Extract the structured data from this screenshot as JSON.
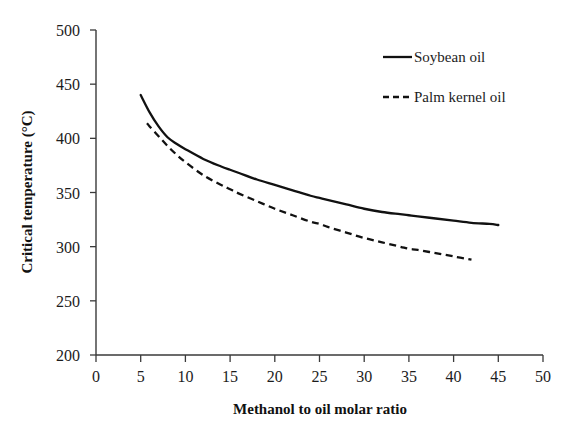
{
  "chart_data": {
    "type": "line",
    "title": "",
    "xlabel": "Methanol to oil molar ratio",
    "ylabel": "Critical temperature (°C)",
    "xlim": [
      0,
      50
    ],
    "ylim": [
      200,
      500
    ],
    "xticks": [
      0,
      5,
      10,
      15,
      20,
      25,
      30,
      35,
      40,
      45,
      50
    ],
    "yticks": [
      200,
      250,
      300,
      350,
      400,
      450,
      500
    ],
    "xtick_labels": [
      "0",
      "5",
      "10",
      "15",
      "20",
      "25",
      "30",
      "35",
      "40",
      "45",
      "50"
    ],
    "ytick_labels": [
      "200",
      "250",
      "300",
      "350",
      "400",
      "450",
      "500"
    ],
    "grid": false,
    "legend_position": "top-right",
    "series": [
      {
        "name": "Soybean oil",
        "style": "solid",
        "color": "#111111",
        "x": [
          5,
          6,
          7,
          8,
          9,
          10,
          12,
          14,
          15,
          16,
          18,
          20,
          22,
          24,
          25,
          26,
          28,
          30,
          32,
          34,
          35,
          36,
          38,
          40,
          42,
          44,
          45
        ],
        "y": [
          440,
          424,
          411,
          401,
          395,
          390,
          381,
          374,
          371,
          368,
          362,
          357,
          352,
          347,
          345,
          343,
          339,
          335,
          332,
          330,
          329,
          328,
          326,
          324,
          322,
          321,
          320
        ]
      },
      {
        "name": "Palm kernel oil",
        "style": "dashed",
        "color": "#111111",
        "x": [
          5.7,
          6,
          7,
          8,
          9,
          10,
          12,
          14,
          15,
          16,
          18,
          20,
          22,
          24,
          25,
          26,
          28,
          30,
          32,
          34,
          35,
          36,
          38,
          40,
          42
        ],
        "y": [
          414,
          411,
          402,
          393,
          385,
          378,
          366,
          357,
          353,
          349,
          342,
          335,
          329,
          323,
          321,
          318,
          313,
          308,
          304,
          300,
          298,
          297,
          294,
          291,
          288
        ]
      }
    ]
  },
  "legend": {
    "entries": [
      {
        "label": "Soybean oil",
        "style": "solid"
      },
      {
        "label": "Palm kernel oil",
        "style": "dashed"
      }
    ]
  },
  "axes": {
    "x_title": "Methanol to oil molar ratio",
    "y_title": "Critical temperature (°C)"
  },
  "colors": {
    "background": "#ffffff",
    "ink": "#111111",
    "axis": "#3a3a3a"
  }
}
